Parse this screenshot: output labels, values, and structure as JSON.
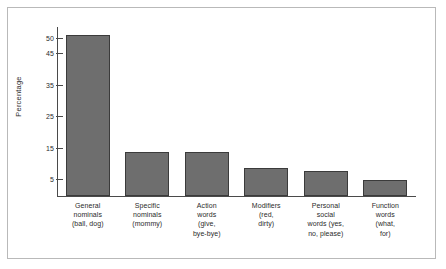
{
  "chart_data": {
    "type": "bar",
    "title": "",
    "xlabel": "",
    "ylabel": "Percentage",
    "ylim": [
      0,
      53
    ],
    "grid": false,
    "legend": null,
    "ytick_values": [
      5,
      15,
      25,
      35,
      45,
      50
    ],
    "ytick_labels": [
      "5",
      "15",
      "25",
      "35",
      "45",
      "50"
    ],
    "categories": [
      "General\nnominals\n(ball, dog)",
      "Specific\nnominals\n(mommy)",
      "Action\nwords\n(give,\nbye-bye)",
      "Modifiers\n(red,\ndirty)",
      "Personal\nsocial\nwords (yes,\nno, please)",
      "Function\nwords\n(what,\nfor)"
    ],
    "values": [
      51,
      14,
      14,
      9,
      8,
      5
    ],
    "bar_color": "#6e6e6e",
    "bar_edge_color": "#3b3b3b",
    "axis_color": "#4a4a4a",
    "frame_color": "#b9b9b9",
    "background_color": "#ffffff"
  }
}
